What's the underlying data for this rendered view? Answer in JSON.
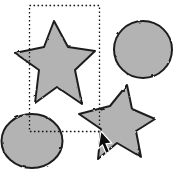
{
  "canvas": {
    "width": 176,
    "height": 171,
    "background": "#ffffff"
  },
  "colors": {
    "shape_fill": "#b3b3b3",
    "shape_stroke": "#1f1f1f",
    "marquee_stroke": "#111111",
    "cursor_fill": "#0d0d0d",
    "cursor_outline": "#ffffff"
  },
  "shapes": [
    {
      "name": "star-top-left",
      "type": "star",
      "selected": true,
      "points": "54,21 68,47 95,51 75,70 82,104 57,87 35,103 39,70 15,53 44,47"
    },
    {
      "name": "ellipse-top-right",
      "type": "ellipse",
      "selected": false,
      "cx": 143,
      "cy": 49.5,
      "rx": 29,
      "ry": 28.5
    },
    {
      "name": "ellipse-bottom-left",
      "type": "ellipse",
      "selected": false,
      "cx": 32,
      "cy": 141,
      "rx": 30.5,
      "ry": 27
    },
    {
      "name": "star-bottom-right",
      "type": "star",
      "selected": false,
      "points": "127,85 132,109 155,119 136,131 141,157 117,143 98,159 101,129 79,114 110,106"
    }
  ],
  "selection_marquee": {
    "x": 29.5,
    "y": 5.5,
    "width": 70,
    "height": 126,
    "dash": "1.6 2.4"
  },
  "cursor": {
    "tip_x": 101,
    "tip_y": 131,
    "points": "101,131 98,149 102.5,145 106,153.5 109.5,151.6 106,143.8 111.7,143"
  }
}
